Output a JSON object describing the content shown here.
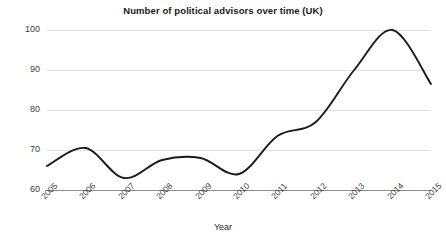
{
  "chart_data": {
    "type": "line",
    "title": "Number of political advisors over time (UK)",
    "xlabel": "Year",
    "ylabel": "",
    "categories": [
      "2005",
      "2006",
      "2007",
      "2008",
      "2009",
      "2010",
      "2011",
      "2012",
      "2013",
      "2014",
      "2015"
    ],
    "x": [
      2005,
      2006,
      2007,
      2008,
      2009,
      2010,
      2011,
      2012,
      2013,
      2014,
      2015
    ],
    "values": [
      66,
      70.5,
      63,
      67.5,
      68,
      64,
      73.5,
      77,
      90,
      100,
      86.5
    ],
    "ylim": [
      60,
      100
    ],
    "yticks": [
      60,
      70,
      80,
      90,
      100
    ],
    "ytick_labels": [
      "60",
      "70",
      "80",
      "90",
      "100"
    ],
    "grid": true,
    "legend": false,
    "line_color": "#1a1a1a",
    "grid_color": "#e2e2e2",
    "smoothing": "spline"
  },
  "watermark": {
    "text": ""
  }
}
